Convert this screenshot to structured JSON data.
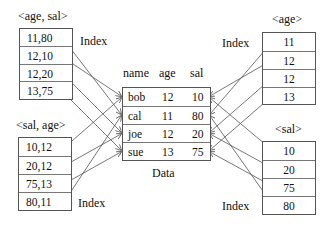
{
  "indexes": {
    "age_sal": {
      "title": "<age, sal>",
      "index_label": "Index",
      "entries": [
        "11,80",
        "12,10",
        "12,20",
        "13,75"
      ],
      "points_to": [
        "cal",
        "bob",
        "joe",
        "sue"
      ]
    },
    "sal_age": {
      "title": "<sal, age>",
      "index_label": "Index",
      "entries": [
        "10,12",
        "20,12",
        "75,13",
        "80,11"
      ],
      "points_to": [
        "bob",
        "joe",
        "sue",
        "cal"
      ]
    },
    "age": {
      "title": "<age>",
      "index_label": "Index",
      "entries": [
        "11",
        "12",
        "12",
        "13"
      ],
      "points_to": [
        "cal",
        "bob",
        "joe",
        "sue"
      ]
    },
    "sal": {
      "title": "<sal>",
      "index_label": "Index",
      "entries": [
        "10",
        "20",
        "75",
        "80"
      ],
      "points_to": [
        "bob",
        "joe",
        "sue",
        "cal"
      ]
    }
  },
  "data_table": {
    "caption": "Data",
    "columns": [
      "name",
      "age",
      "sal"
    ],
    "rows": [
      {
        "name": "bob",
        "age": "12",
        "sal": "10"
      },
      {
        "name": "cal",
        "age": "11",
        "sal": "80"
      },
      {
        "name": "joe",
        "age": "12",
        "sal": "20"
      },
      {
        "name": "sue",
        "age": "13",
        "sal": "75"
      }
    ]
  },
  "colors": {
    "line": "#555555",
    "border": "#555555",
    "text": "#111111"
  }
}
